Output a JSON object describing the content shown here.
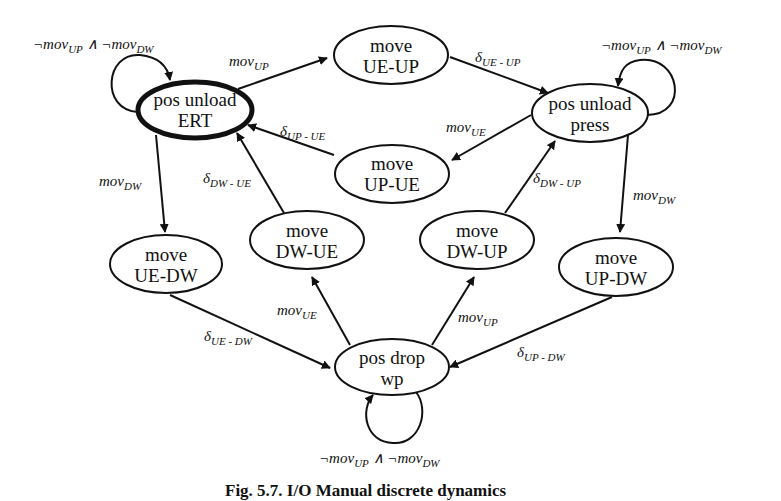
{
  "diagram": {
    "type": "state-machine",
    "nodes": [
      {
        "id": "pos_unload_ert",
        "line1": "pos unload",
        "line2": "ERT",
        "initial": true
      },
      {
        "id": "move_ue_up",
        "line1": "move",
        "line2": "UE-UP"
      },
      {
        "id": "pos_unload_press",
        "line1": "pos unload",
        "line2": "press"
      },
      {
        "id": "move_up_ue",
        "line1": "move",
        "line2": "UP-UE"
      },
      {
        "id": "move_ue_dw",
        "line1": "move",
        "line2": "UE-DW"
      },
      {
        "id": "move_dw_ue",
        "line1": "move",
        "line2": "DW-UE"
      },
      {
        "id": "move_dw_up",
        "line1": "move",
        "line2": "DW-UP"
      },
      {
        "id": "move_up_dw",
        "line1": "move",
        "line2": "UP-DW"
      },
      {
        "id": "pos_drop_wp",
        "line1": "pos drop",
        "line2": "wp"
      }
    ],
    "edges": [
      {
        "from": "pos_unload_ert",
        "to": "pos_unload_ert",
        "base": "¬mov",
        "sub": "UP",
        "op": " ∧ ¬mov",
        "sub2": "DW"
      },
      {
        "from": "pos_unload_ert",
        "to": "move_ue_up",
        "base": "mov",
        "sub": "UP"
      },
      {
        "from": "move_ue_up",
        "to": "pos_unload_press",
        "base": "δ",
        "sub": "UE - UP"
      },
      {
        "from": "pos_unload_press",
        "to": "pos_unload_press",
        "base": "¬mov",
        "sub": "UP",
        "op": " ∧ ¬mov",
        "sub2": "DW"
      },
      {
        "from": "pos_unload_press",
        "to": "move_up_ue",
        "base": "mov",
        "sub": "UE"
      },
      {
        "from": "move_up_ue",
        "to": "pos_unload_ert",
        "base": "δ",
        "sub": "UP - UE"
      },
      {
        "from": "pos_unload_ert",
        "to": "move_ue_dw",
        "base": "mov",
        "sub": "DW"
      },
      {
        "from": "move_dw_ue",
        "to": "pos_unload_ert",
        "base": "δ",
        "sub": "DW - UE"
      },
      {
        "from": "move_dw_up",
        "to": "pos_unload_press",
        "base": "δ",
        "sub": "DW - UP"
      },
      {
        "from": "pos_unload_press",
        "to": "move_up_dw",
        "base": "mov",
        "sub": "DW"
      },
      {
        "from": "move_ue_dw",
        "to": "pos_drop_wp",
        "base": "δ",
        "sub": "UE - DW"
      },
      {
        "from": "pos_drop_wp",
        "to": "move_dw_ue",
        "base": "mov",
        "sub": "UE"
      },
      {
        "from": "pos_drop_wp",
        "to": "move_dw_up",
        "base": "mov",
        "sub": "UP"
      },
      {
        "from": "move_up_dw",
        "to": "pos_drop_wp",
        "base": "δ",
        "sub": "UP - DW"
      },
      {
        "from": "pos_drop_wp",
        "to": "pos_drop_wp",
        "base": "¬mov",
        "sub": "UP",
        "op": " ∧ ¬mov",
        "sub2": "DW"
      }
    ]
  },
  "caption": "Fig. 5.7. I/O Manual discrete dynamics"
}
